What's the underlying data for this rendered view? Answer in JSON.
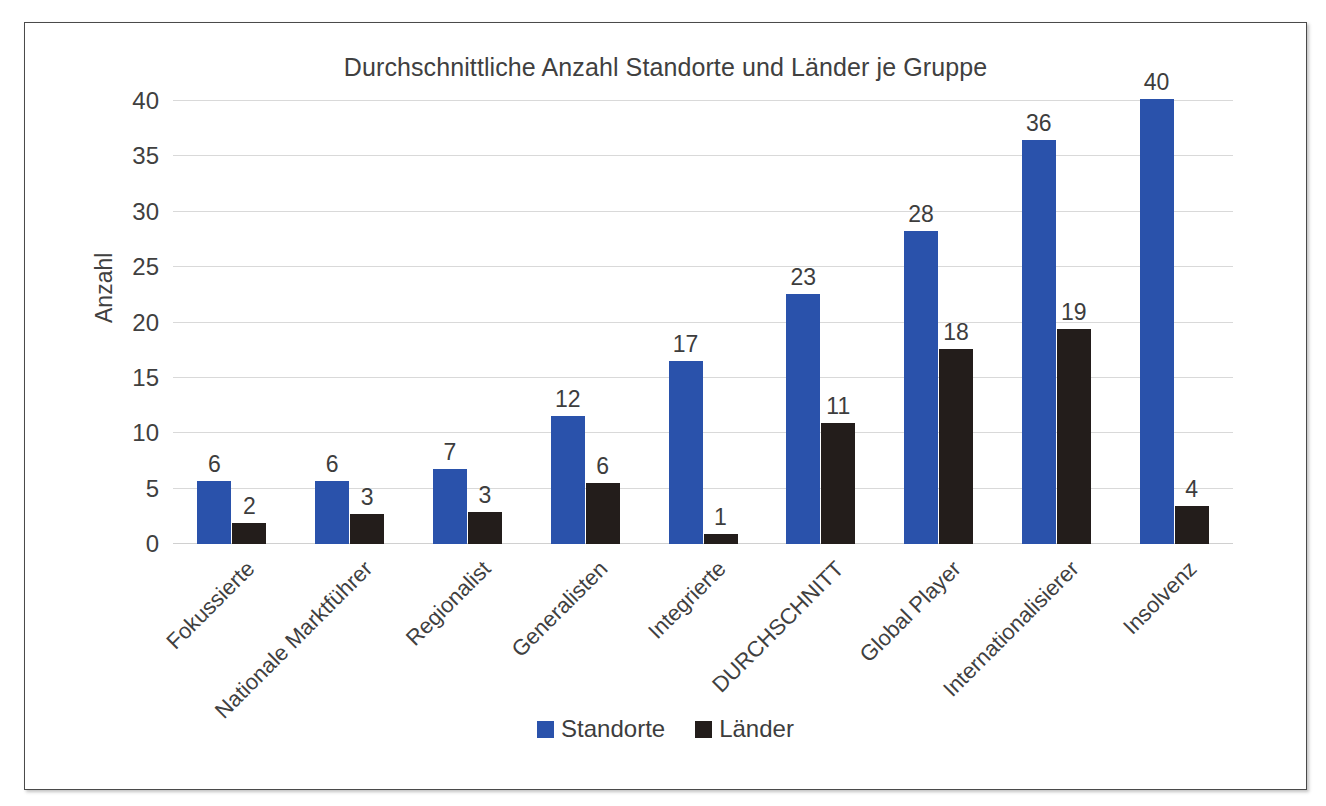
{
  "chart_data": {
    "type": "bar",
    "title": "Durchschnittliche Anzahl Standorte und Länder je Gruppe",
    "xlabel": "",
    "ylabel": "Anzahl",
    "ylim": [
      0,
      40
    ],
    "ytick_step": 5,
    "yticks": [
      "40",
      "35",
      "30",
      "25",
      "20",
      "15",
      "10",
      "5",
      "0"
    ],
    "grid": true,
    "legend_position": "bottom",
    "categories": [
      "Fokussierte",
      "Nationale Marktführer",
      "Regionalist",
      "Generalisten",
      "Integrierte",
      "DURCHSCHNITT",
      "Global Player",
      "Internationalisierer",
      "Insolvenz"
    ],
    "series": [
      {
        "name": "Standorte",
        "color": "#2a52ab",
        "values": [
          5.7,
          5.7,
          6.8,
          11.6,
          16.5,
          22.6,
          28.3,
          36.5,
          40.2
        ],
        "labels": [
          "6",
          "6",
          "7",
          "12",
          "17",
          "23",
          "28",
          "36",
          "40"
        ]
      },
      {
        "name": "Länder",
        "color": "#231d1b",
        "values": [
          1.9,
          2.7,
          2.9,
          5.5,
          0.9,
          10.9,
          17.6,
          19.4,
          3.4
        ],
        "labels": [
          "2",
          "3",
          "3",
          "6",
          "1",
          "11",
          "18",
          "19",
          "4"
        ]
      }
    ]
  },
  "legend": {
    "items": [
      {
        "label": "Standorte",
        "color": "#2a52ab"
      },
      {
        "label": "Länder",
        "color": "#231d1b"
      }
    ]
  }
}
